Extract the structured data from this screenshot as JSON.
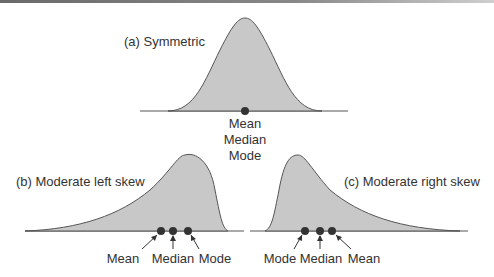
{
  "panels": {
    "a": {
      "title": "(a) Symmetric",
      "labels": [
        "Mean",
        "Median",
        "Mode"
      ]
    },
    "b": {
      "title": "(b) Moderate left skew",
      "labels": [
        "Mean",
        "Median",
        "Mode"
      ]
    },
    "c": {
      "title": "(c) Moderate right skew",
      "labels": [
        "Mode",
        "Median",
        "Mean"
      ]
    }
  },
  "colors": {
    "fill": "#c8c8c8",
    "stroke": "#555555",
    "dot": "#333333",
    "text": "#333333"
  }
}
